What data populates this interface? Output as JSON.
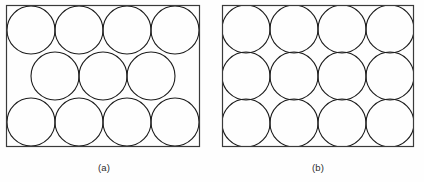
{
  "figure": {
    "background_color": "#fefefe",
    "stroke_color": "#1d1d1d",
    "border_color": "#3a3a3a",
    "caption_color": "#2b2b2b",
    "width": 424,
    "height": 182
  },
  "panels": [
    {
      "id": "panel-a",
      "caption": "(a)",
      "packing_name": "hexagonal-packing",
      "rect": {
        "x": 6,
        "y": 5,
        "width": 194,
        "height": 142
      },
      "circle_radius": 24,
      "circle_count": 11,
      "rows": [
        {
          "name": "top-row",
          "count": 4,
          "cy": 30,
          "cx": [
            31,
            79,
            127,
            175
          ]
        },
        {
          "name": "middle-row",
          "count": 3,
          "cy": 76,
          "cx": [
            55,
            103,
            151
          ]
        },
        {
          "name": "bottom-row",
          "count": 4,
          "cy": 122,
          "cx": [
            31,
            79,
            127,
            175
          ]
        }
      ]
    },
    {
      "id": "panel-b",
      "caption": "(b)",
      "packing_name": "square-packing",
      "rect": {
        "x": 222,
        "y": 5,
        "width": 192,
        "height": 142
      },
      "circle_radius": 24,
      "circle_count": 12,
      "rows": [
        {
          "name": "top-row",
          "count": 4,
          "cy": 29,
          "cx": [
            246,
            294,
            342,
            390
          ]
        },
        {
          "name": "middle-row",
          "count": 4,
          "cy": 76,
          "cx": [
            246,
            294,
            342,
            390
          ]
        },
        {
          "name": "bottom-row",
          "count": 4,
          "cy": 123,
          "cx": [
            246,
            294,
            342,
            390
          ]
        }
      ]
    }
  ],
  "chart_data": {
    "type": "diagram",
    "title": "",
    "panels": [
      {
        "label": "(a)",
        "arrangement": "hexagonal / staggered",
        "circles": 11,
        "rows": [
          4,
          3,
          4
        ]
      },
      {
        "label": "(b)",
        "arrangement": "square / aligned grid",
        "circles": 12,
        "rows": [
          4,
          4,
          4
        ]
      }
    ]
  }
}
